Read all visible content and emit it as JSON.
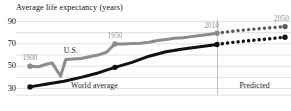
{
  "chart_data": {
    "type": "line",
    "title": "Average life expectancy (years)",
    "xlabel": "",
    "ylabel": "Average life expectancy (years)",
    "ylim": [
      25,
      92
    ],
    "yticks": [
      30,
      50,
      70,
      90
    ],
    "ytick_labels": [
      "30",
      "50",
      "70",
      "90"
    ],
    "xlim": [
      1900,
      2050
    ],
    "grid": true,
    "legend": "inline-annotations",
    "divider_x": 2010,
    "divider_label": "Predicted",
    "series": [
      {
        "name": "U.S.",
        "color": "#8c8c8c",
        "style": "solid",
        "x": [
          1900,
          1905,
          1910,
          1913,
          1918,
          1921,
          1925,
          1930,
          1935,
          1940,
          1945,
          1950,
          1955,
          1960,
          1965,
          1970,
          1975,
          1980,
          1985,
          1990,
          1995,
          2000,
          2005,
          2010
        ],
        "y": [
          49.5,
          49.0,
          51.5,
          52.5,
          40.5,
          55.5,
          56.0,
          56.5,
          58.0,
          59.5,
          62.0,
          69.5,
          69.5,
          69.8,
          70.0,
          71.0,
          72.5,
          73.5,
          74.5,
          75.0,
          76.0,
          77.0,
          78.0,
          79.0
        ],
        "marker_points": [
          {
            "x": 1900,
            "y": 49.5
          },
          {
            "x": 1950,
            "y": 69.5
          },
          {
            "x": 2010,
            "y": 79.0
          }
        ]
      },
      {
        "name": "U.S. predicted",
        "color": "#5a5a5a",
        "style": "dotted",
        "x": [
          2010,
          2020,
          2030,
          2040,
          2050
        ],
        "y": [
          79.0,
          81.0,
          82.5,
          83.8,
          85.0
        ],
        "marker_points": [
          {
            "x": 2050,
            "y": 85.0
          }
        ]
      },
      {
        "name": "World average",
        "color": "#111111",
        "style": "solid",
        "x": [
          1900,
          1910,
          1920,
          1930,
          1940,
          1950,
          1960,
          1970,
          1980,
          1990,
          2000,
          2010
        ],
        "y": [
          31.0,
          33.5,
          36.0,
          39.5,
          43.5,
          48.5,
          53.0,
          58.5,
          62.5,
          65.0,
          67.0,
          69.0
        ],
        "marker_points": [
          {
            "x": 1900,
            "y": 31.0
          },
          {
            "x": 1950,
            "y": 48.5
          },
          {
            "x": 2010,
            "y": 69.0
          }
        ]
      },
      {
        "name": "World average predicted",
        "color": "#111111",
        "style": "dotted",
        "x": [
          2010,
          2020,
          2030,
          2040,
          2050
        ],
        "y": [
          69.0,
          71.0,
          72.5,
          74.0,
          75.5
        ],
        "marker_points": [
          {
            "x": 2050,
            "y": 75.5
          }
        ]
      }
    ],
    "annotations": [
      {
        "text": "1900",
        "x": 1900,
        "y": 56,
        "color": "#8e8e8e"
      },
      {
        "text": "U.S.",
        "x": 1924,
        "y": 63,
        "color": "#1a1a1a"
      },
      {
        "text": "1950",
        "x": 1950,
        "y": 76,
        "color": "#8e8e8e"
      },
      {
        "text": "2010",
        "x": 2007,
        "y": 85,
        "color": "#8e8e8e"
      },
      {
        "text": "2050",
        "x": 2048,
        "y": 91,
        "color": "#8e8e8e"
      },
      {
        "text": "World average",
        "x": 1938,
        "y": 32,
        "color": "#1a1a1a"
      },
      {
        "text": "Predicted",
        "x": 2032,
        "y": 32,
        "color": "#1a1a1a"
      }
    ]
  },
  "axis": {
    "tick_90": "90",
    "tick_70": "70",
    "tick_50": "50",
    "tick_30": "30"
  },
  "labels": {
    "title": "Average life expectancy (years)",
    "year_1900": "1900",
    "us": "U.S.",
    "year_1950": "1950",
    "year_2010": "2010",
    "year_2050": "2050",
    "world_average": "World average",
    "predicted": "Predicted"
  },
  "colors": {
    "us_line": "#8c8c8c",
    "world_line": "#111111",
    "grid": "#d8d8d8",
    "divider": "#b5b5b5",
    "annotation_grey": "#8e8e8e",
    "background": "#ffffff"
  }
}
